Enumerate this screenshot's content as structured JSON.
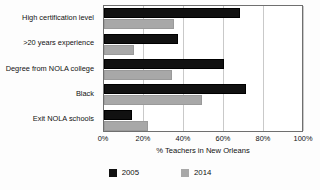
{
  "chart_data": {
    "type": "bar",
    "orientation": "horizontal",
    "title": "",
    "xlabel": "% Teachers in New Orleans",
    "ylabel": "",
    "xlim": [
      0,
      100
    ],
    "xticks": [
      "0%",
      "20%",
      "40%",
      "60%",
      "80%",
      "100%"
    ],
    "xtick_values": [
      0,
      20,
      40,
      60,
      80,
      100
    ],
    "grid": true,
    "grid_axis": "x",
    "legend_position": "bottom",
    "categories": [
      "High certification level",
      ">20 years experience",
      "Degree from NOLA college",
      "Black",
      "Exit NOLA schools"
    ],
    "series": [
      {
        "name": "2005",
        "color": "#111111",
        "values": [
          68,
          37,
          60,
          71,
          14
        ]
      },
      {
        "name": "2014",
        "color": "#a8a8a8",
        "values": [
          35,
          15,
          34,
          49,
          22
        ]
      }
    ]
  }
}
